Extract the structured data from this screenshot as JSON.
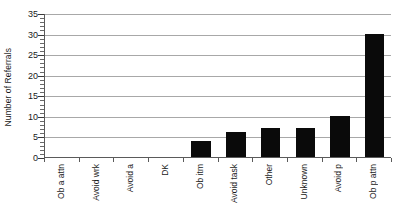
{
  "chart_data": {
    "type": "bar",
    "title": "",
    "subtitle": "",
    "xlabel": "",
    "ylabel": "Number of Referrals",
    "categories": [
      "Ob a attn",
      "Avoid wrk",
      "Avoid a",
      "DK",
      "Ob itm",
      "Avoid task",
      "Other",
      "Unknown",
      "Avoid p",
      "Ob p attn"
    ],
    "values": [
      0,
      0,
      0,
      0,
      4,
      6,
      7,
      7,
      10,
      30
    ],
    "ylim": [
      0,
      35
    ],
    "ytick_labels": [
      "0",
      "5",
      "10",
      "15",
      "20",
      "25",
      "30",
      "35"
    ],
    "ytick_values": [
      0,
      5,
      10,
      15,
      20,
      25,
      30,
      35
    ],
    "ytick_step": 5,
    "minor_tick_step": 1,
    "grid": "horizontal",
    "legend": "none",
    "bar_color": "#0a0a0a",
    "gridline_color": "#a8a8a8",
    "axis_color": "#5a5a5a",
    "background_color": "#ffffff",
    "xlabel_rotation": 90
  }
}
